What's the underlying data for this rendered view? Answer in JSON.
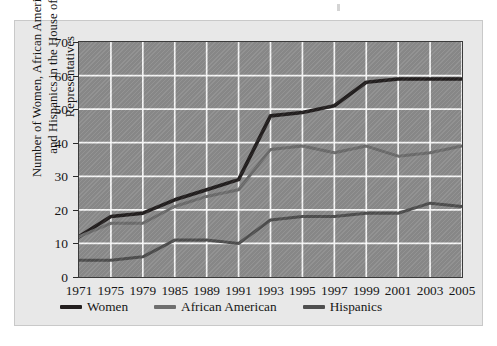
{
  "chart_data": {
    "type": "line",
    "title": "",
    "subtitle": "",
    "xlabel": "",
    "ylabel": "Number of Women, African Americans and Hispanics in the House of Representatives",
    "ylabel_line1": "Number of Women, African Americans",
    "ylabel_line2": "and Hispanics in the House of Representatives",
    "categories": [
      "1971",
      "1975",
      "1979",
      "1985",
      "1989",
      "1991",
      "1993",
      "1995",
      "1997",
      "1999",
      "2001",
      "2003",
      "2005"
    ],
    "x": [
      1971,
      1975,
      1979,
      1985,
      1989,
      1991,
      1993,
      1995,
      1997,
      1999,
      2001,
      2003,
      2005
    ],
    "xlim": [
      1971,
      2005
    ],
    "ylim": [
      0,
      70
    ],
    "yticks": [
      0,
      10,
      20,
      30,
      40,
      50,
      60,
      70
    ],
    "ytick_labels": [
      "0",
      "10",
      "20",
      "30",
      "40",
      "50",
      "60",
      "70"
    ],
    "grid": true,
    "grid_color": "#ffffff",
    "plot_background": "#8d8d8d",
    "legend_position": "bottom-left",
    "series": [
      {
        "name": "Women",
        "color": "#231f1f",
        "values": [
          12,
          18,
          19,
          23,
          26,
          29,
          48,
          49,
          51,
          58,
          59,
          59,
          59
        ]
      },
      {
        "name": "African American",
        "color": "#6e6e6e",
        "values": [
          12,
          16,
          16,
          21,
          24,
          26,
          38,
          39,
          37,
          39,
          36,
          37,
          39
        ]
      },
      {
        "name": "Hispanics",
        "color": "#4f4f4f",
        "values": [
          5,
          5,
          6,
          11,
          11,
          10,
          17,
          18,
          18,
          19,
          19,
          22,
          21
        ]
      }
    ]
  },
  "legend": {
    "items": [
      {
        "label": "Women",
        "color": "#231f1f"
      },
      {
        "label": "African American",
        "color": "#6e6e6e"
      },
      {
        "label": "Hispanics",
        "color": "#4f4f4f"
      }
    ]
  }
}
